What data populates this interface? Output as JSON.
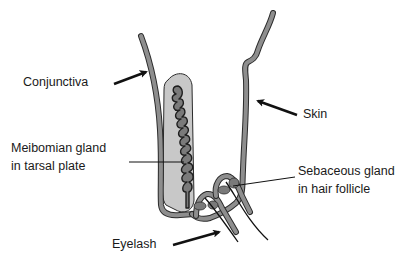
{
  "diagram": {
    "labels": {
      "conjunctiva": "Conjunctiva",
      "skin": "Skin",
      "meibomian_line1": "Meibomian gland",
      "meibomian_line2": "in tarsal plate",
      "sebaceous_line1": "Sebaceous gland",
      "sebaceous_line2": "in hair follicle",
      "eyelash": "Eyelash"
    },
    "colors": {
      "tissue_fill": "#8e8e8e",
      "tissue_outline": "#2b2b2b",
      "tarsal_plate": "#c8c8c8",
      "gland_fill": "#7a7a7a",
      "text": "#1a1a1a",
      "arrow": "#111111",
      "background": "#ffffff"
    }
  }
}
